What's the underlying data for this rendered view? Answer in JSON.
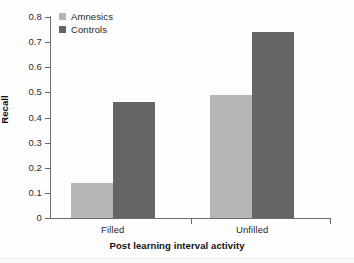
{
  "chart_data": {
    "type": "bar",
    "title": "",
    "xlabel": "Post learning interval activity",
    "ylabel": "Recall",
    "categories": [
      "Filled",
      "Unfilled"
    ],
    "series": [
      {
        "name": "Amnesics",
        "color": "#b6b6b6",
        "values": [
          0.14,
          0.49
        ]
      },
      {
        "name": "Controls",
        "color": "#656565",
        "values": [
          0.46,
          0.74
        ]
      }
    ],
    "ylim": [
      0,
      0.8
    ],
    "ytick_values": [
      0,
      0.1,
      0.2,
      0.3,
      0.4,
      0.5,
      0.6,
      0.7,
      0.8
    ],
    "ytick_labels": [
      "0",
      "0.1",
      "0.2",
      "0.3",
      "0.4",
      "0.5",
      "0.6",
      "0.7",
      "0.8"
    ],
    "grid": false,
    "legend_position": "top-left"
  },
  "legend": {
    "items": [
      {
        "label": "Amnesics"
      },
      {
        "label": "Controls"
      }
    ]
  }
}
